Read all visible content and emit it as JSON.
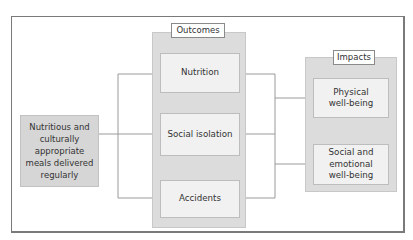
{
  "diagram": {
    "input": {
      "label": "Nutritious and culturally appropriate meals delivered regularly"
    },
    "outcomes": {
      "title": "Outcomes",
      "items": [
        {
          "label": "Nutrition"
        },
        {
          "label": "Social isolation"
        },
        {
          "label": "Accidents"
        }
      ]
    },
    "impacts": {
      "title": "Impacts",
      "items": [
        {
          "label": "Physical well-being"
        },
        {
          "label": "Social and emotional well-being"
        }
      ]
    },
    "colors": {
      "panel": "#dcdcdc",
      "box": "#f1f1f1",
      "connector": "#9a9a9a",
      "frame": "#7a7a7a"
    }
  }
}
